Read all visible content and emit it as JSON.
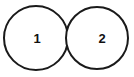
{
  "figure": {
    "type": "node-diagram",
    "title": "",
    "background_color": "#ffffff",
    "stroke_color": "#1a1a1a",
    "label_color": "#111111",
    "stroke_width": 2,
    "canvas": {
      "width": 134,
      "height": 77
    }
  },
  "nodes": [
    {
      "id": "node-1",
      "label": "1",
      "cx": 36,
      "cy": 38,
      "r": 32,
      "label_x": 37,
      "label_y": 38
    },
    {
      "id": "node-2",
      "label": "2",
      "cx": 97,
      "cy": 38,
      "r": 31,
      "label_x": 102,
      "label_y": 38
    }
  ],
  "relations": [
    {
      "from": "node-1",
      "to": "node-2",
      "kind": "tangent",
      "label": ""
    }
  ]
}
